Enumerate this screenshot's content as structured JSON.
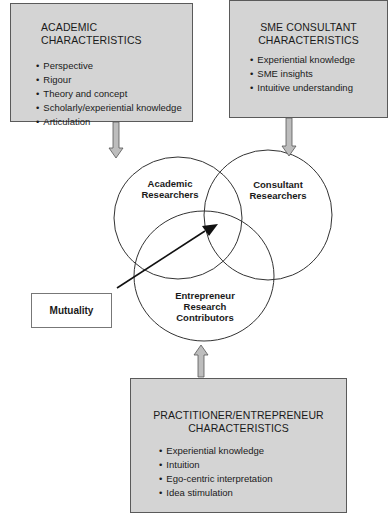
{
  "academic": {
    "title": "ACADEMIC CHARACTERISTICS",
    "items": [
      "Perspective",
      "Rigour",
      "Theory and concept",
      "Scholarly/experiential knowledge",
      "Articulation"
    ]
  },
  "sme": {
    "title_line1": "SME CONSULTANT",
    "title_line2": "CHARACTERISTICS",
    "items": [
      "Experiential knowledge",
      "SME insights",
      "Intuitive understanding"
    ]
  },
  "practitioner": {
    "title_line1": "PRACTITIONER/ENTREPRENEUR",
    "title_line2": "CHARACTERISTICS",
    "items": [
      "Experiential knowledge",
      "Intuition",
      "Ego-centric interpretation",
      "Idea stimulation"
    ]
  },
  "circles": {
    "academic": {
      "line1": "Academic",
      "line2": "Researchers"
    },
    "consultant": {
      "line1": "Consultant",
      "line2": "Researchers"
    },
    "entrepreneur": {
      "line1": "Entrepreneur",
      "line2": "Research",
      "line3": "Contributors"
    }
  },
  "mutuality": {
    "label": "Mutuality"
  },
  "colors": {
    "box_fill": "#d4d4d4",
    "box_border": "#5a5a5a",
    "arrow_fill": "#bdbdbd",
    "line": "#333333"
  }
}
